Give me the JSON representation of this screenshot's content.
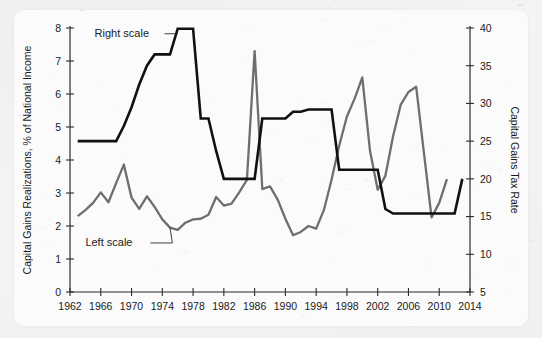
{
  "page": {
    "background_color": "#f1f1f1",
    "card_color": "#fbfbfb"
  },
  "chart_data": {
    "type": "line",
    "title": "",
    "xlabel": "",
    "ylabel": "Capital Gains Realizations, % of National Income",
    "y2label": "Capital Gains Tax Rate",
    "xlim": [
      1962,
      2014
    ],
    "ylim": [
      0,
      8
    ],
    "y2lim": [
      5,
      40
    ],
    "xticks": [
      1962,
      1966,
      1970,
      1974,
      1978,
      1982,
      1986,
      1990,
      1994,
      1998,
      2002,
      2006,
      2010,
      2014
    ],
    "xtick_labels": [
      "1962",
      "1966",
      "1970",
      "1974",
      "1978",
      "1982",
      "1986",
      "1990",
      "1994",
      "1998",
      "2002",
      "2006",
      "2010",
      "2014"
    ],
    "yticks": [
      0,
      1,
      2,
      3,
      4,
      5,
      6,
      7,
      8
    ],
    "ytick_labels": [
      "0",
      "1",
      "2",
      "3",
      "4",
      "5",
      "6",
      "7",
      "8"
    ],
    "y2ticks": [
      5,
      10,
      15,
      20,
      25,
      30,
      35,
      40
    ],
    "y2tick_labels": [
      "5",
      "10",
      "15",
      "20",
      "25",
      "30",
      "35",
      "40"
    ],
    "grid": false,
    "legend_position": "inline-annotations",
    "annotations": [
      {
        "text": "Right scale",
        "target_series": "capital-gains-tax-rate",
        "label_x": 1965.2,
        "label_y_value": 7.72,
        "leader_to_x": 1976.0,
        "leader_to_y_value": 7.78
      },
      {
        "text": "Left scale",
        "target_series": "capital-gains-realizations",
        "label_x": 1964.0,
        "label_y_value": 1.38,
        "leader_to_x": 1975.0,
        "leader_to_y_value": 1.95
      }
    ],
    "series": [
      {
        "name": "Capital Gains Realizations, % of National Income",
        "short_name": "Left scale",
        "axis": "left",
        "color": "#6e6e6e",
        "x": [
          1963,
          1964,
          1965,
          1966,
          1967,
          1968,
          1969,
          1970,
          1971,
          1972,
          1973,
          1974,
          1975,
          1976,
          1977,
          1978,
          1979,
          1980,
          1981,
          1982,
          1983,
          1984,
          1985,
          1986,
          1987,
          1988,
          1989,
          1990,
          1991,
          1992,
          1993,
          1994,
          1995,
          1996,
          1997,
          1998,
          1999,
          2000,
          2001,
          2002,
          2003,
          2004,
          2005,
          2006,
          2007,
          2008,
          2009,
          2010,
          2011
        ],
        "values": [
          2.3,
          2.48,
          2.7,
          3.02,
          2.72,
          3.3,
          3.86,
          2.86,
          2.52,
          2.9,
          2.58,
          2.2,
          1.95,
          1.88,
          2.1,
          2.2,
          2.22,
          2.34,
          2.88,
          2.62,
          2.68,
          3.02,
          3.4,
          7.3,
          3.12,
          3.2,
          2.8,
          2.22,
          1.72,
          1.82,
          2.0,
          1.92,
          2.48,
          3.4,
          4.44,
          5.32,
          5.86,
          6.5,
          4.28,
          3.1,
          3.52,
          4.72,
          5.68,
          6.06,
          6.22,
          4.24,
          2.26,
          2.7,
          3.42
        ]
      },
      {
        "name": "Capital Gains Tax Rate",
        "short_name": "Right scale",
        "axis": "right",
        "color": "#111111",
        "x": [
          1963,
          1964,
          1965,
          1966,
          1967,
          1968,
          1969,
          1970,
          1971,
          1972,
          1973,
          1974,
          1975,
          1976,
          1977,
          1978,
          1979,
          1980,
          1981,
          1982,
          1983,
          1984,
          1985,
          1986,
          1987,
          1988,
          1989,
          1990,
          1991,
          1992,
          1993,
          1994,
          1995,
          1996,
          1997,
          1998,
          1999,
          2000,
          2001,
          2002,
          2003,
          2004,
          2005,
          2006,
          2007,
          2008,
          2009,
          2010,
          2011,
          2012,
          2013
        ],
        "values": [
          25.0,
          25.0,
          25.0,
          25.0,
          25.0,
          25.0,
          27.0,
          29.5,
          32.5,
          35.0,
          36.5,
          36.5,
          36.5,
          39.9,
          39.9,
          39.9,
          28.0,
          28.0,
          23.7,
          20.0,
          20.0,
          20.0,
          20.0,
          20.0,
          28.0,
          28.0,
          28.0,
          28.0,
          28.9,
          28.9,
          29.2,
          29.2,
          29.2,
          29.2,
          21.2,
          21.2,
          21.2,
          21.2,
          21.2,
          21.2,
          16.0,
          15.4,
          15.4,
          15.4,
          15.4,
          15.4,
          15.4,
          15.4,
          15.4,
          15.4,
          20.0
        ]
      }
    ]
  }
}
